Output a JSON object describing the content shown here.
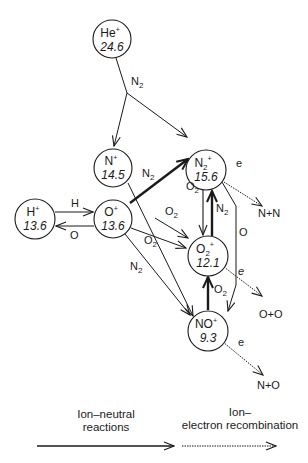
{
  "nodes": [
    {
      "id": "He",
      "ion": "He",
      "sub": "",
      "charge": "+",
      "energy": "24.6"
    },
    {
      "id": "N",
      "ion": "N",
      "sub": "",
      "charge": "+",
      "energy": "14.5"
    },
    {
      "id": "N2",
      "ion": "N",
      "sub": "2",
      "charge": "+",
      "energy": "15.6"
    },
    {
      "id": "H",
      "ion": "H",
      "sub": "",
      "charge": "+",
      "energy": "13.6"
    },
    {
      "id": "O",
      "ion": "O",
      "sub": "",
      "charge": "+",
      "energy": "13.6"
    },
    {
      "id": "O2",
      "ion": "O",
      "sub": "2",
      "charge": "+",
      "energy": "12.1"
    },
    {
      "id": "NO",
      "ion": "NO",
      "sub": "",
      "charge": "+",
      "energy": "9.3"
    }
  ],
  "reactions": {
    "he_n2": {
      "base": "N",
      "sub": "2"
    },
    "h_to_o": "H",
    "o_to_h": "O",
    "n_n2": {
      "base": "N",
      "sub": "2"
    },
    "o_o2_upper": {
      "base": "O",
      "sub": "2"
    },
    "o_o2_lower": {
      "base": "O",
      "sub": "2"
    },
    "o_n2": {
      "base": "N",
      "sub": "2"
    },
    "n2_o2": {
      "base": "O",
      "sub": "2"
    },
    "o2_n2": {
      "base": "N",
      "sub": "2"
    },
    "no_o2": {
      "base": "O",
      "sub": "2"
    },
    "n2_o": "O"
  },
  "recombination": {
    "electron_label": "e",
    "products": [
      "N+N",
      "O+O",
      "N+O"
    ]
  },
  "legend": {
    "solid": [
      "Ion–neutral",
      "reactions"
    ],
    "dotted": [
      "Ion–",
      "electron recombination"
    ]
  }
}
